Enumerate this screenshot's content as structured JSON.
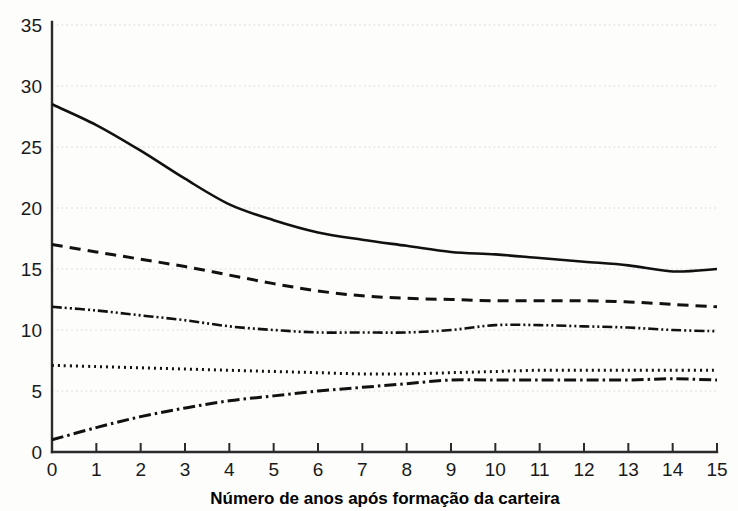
{
  "chart_data": {
    "type": "line",
    "title": "",
    "xlabel": "Número de anos após formação da carteira",
    "ylabel": "",
    "xlim": [
      0,
      15
    ],
    "ylim": [
      0,
      35
    ],
    "grid": true,
    "legend": "none",
    "x_ticks": [
      "0",
      "1",
      "2",
      "3",
      "4",
      "5",
      "6",
      "7",
      "8",
      "9",
      "10",
      "11",
      "12",
      "13",
      "14",
      "15"
    ],
    "y_ticks": [
      "0",
      "5",
      "10",
      "15",
      "20",
      "25",
      "30",
      "35"
    ],
    "x": [
      0,
      1,
      2,
      3,
      4,
      5,
      6,
      7,
      8,
      9,
      10,
      11,
      12,
      13,
      14,
      15
    ],
    "series": [
      {
        "name": "serie-solida",
        "style": "solid",
        "dasharray": "",
        "width": 2.6,
        "values": [
          28.5,
          26.8,
          24.7,
          22.4,
          20.3,
          19.0,
          18.0,
          17.4,
          16.9,
          16.4,
          16.2,
          15.9,
          15.6,
          15.3,
          14.8,
          15.0
        ]
      },
      {
        "name": "serie-tracejada",
        "style": "dashed",
        "dasharray": "11 7",
        "width": 3.0,
        "values": [
          17.0,
          16.4,
          15.8,
          15.2,
          14.5,
          13.8,
          13.2,
          12.8,
          12.6,
          12.5,
          12.4,
          12.4,
          12.4,
          12.3,
          12.1,
          11.9
        ]
      },
      {
        "name": "serie-traco-ponto-ponto",
        "style": "dash-dot-dot",
        "dasharray": "10 3 2 3 2 3",
        "width": 2.6,
        "values": [
          11.9,
          11.6,
          11.2,
          10.8,
          10.3,
          10.0,
          9.8,
          9.8,
          9.8,
          10.0,
          10.4,
          10.4,
          10.3,
          10.2,
          10.0,
          9.9
        ]
      },
      {
        "name": "serie-pontilhada",
        "style": "dotted",
        "dasharray": "2 4",
        "width": 3.0,
        "values": [
          7.1,
          7.0,
          6.9,
          6.8,
          6.7,
          6.6,
          6.5,
          6.4,
          6.4,
          6.5,
          6.6,
          6.7,
          6.7,
          6.7,
          6.7,
          6.7
        ]
      },
      {
        "name": "serie-traco-ponto",
        "style": "dash-dot",
        "dasharray": "12 4 2.5 4",
        "width": 3.0,
        "values": [
          1.0,
          2.0,
          2.9,
          3.6,
          4.2,
          4.6,
          5.0,
          5.3,
          5.6,
          5.9,
          5.9,
          5.9,
          5.9,
          5.9,
          6.0,
          5.9
        ]
      }
    ]
  },
  "axis": {
    "x_axis_label": "Número de anos após formação da carteira"
  }
}
